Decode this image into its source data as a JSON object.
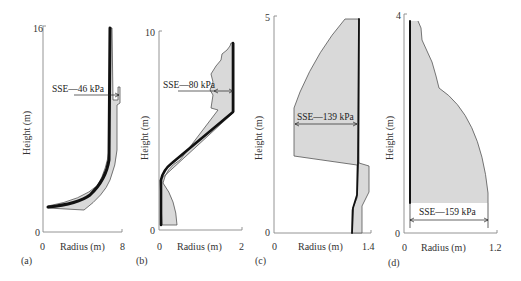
{
  "figure": {
    "panels": [
      {
        "id": "a",
        "tag": "(a)",
        "ymax": "16",
        "ymin": "0",
        "xmin": "0",
        "xmax": "8",
        "ylabel": "Height (m)",
        "xlabel": "Radius (m)",
        "annotation": "SSE—46 kPa"
      },
      {
        "id": "b",
        "tag": "(b)",
        "ymax": "10",
        "ymin": "0",
        "xmin": "0",
        "xmax": "2",
        "ylabel": "Height (m)",
        "xlabel": "Radius (m)",
        "annotation": "SSE—80 kPa"
      },
      {
        "id": "c",
        "tag": "(c)",
        "ymax": "5",
        "ymin": "0",
        "xmin": "0",
        "xmax": "1.4",
        "ylabel": "Height (m)",
        "xlabel": "Radius (m)",
        "annotation": "SSE—139 kPa"
      },
      {
        "id": "d",
        "tag": "(d)",
        "ymax": "4",
        "ymin": "0",
        "xmin": "0",
        "xmax": "1.2",
        "ylabel": "Height (m)",
        "xlabel": "Radius (m)",
        "annotation": "SSE—159 kPa"
      }
    ]
  },
  "colors": {
    "envelope_fill": "#d9d9d9",
    "profile_line": "#111111",
    "axis": "#888888"
  }
}
